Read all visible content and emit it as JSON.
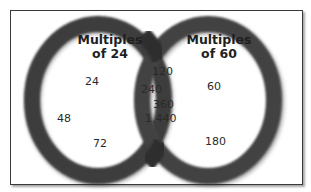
{
  "diagram": {
    "type": "venn",
    "colors": {
      "ring": "#3c3c3c",
      "ring_overlap": "#262626",
      "frame_border": "#3a3a3a",
      "background": "#ffffff",
      "text": "#2a2a2a"
    },
    "sets": [
      {
        "id": "A",
        "title_line1": "Multiples",
        "title_line2": "of 24",
        "only": [
          "24",
          "48",
          "72"
        ]
      },
      {
        "id": "B",
        "title_line1": "Multiples",
        "title_line2": "of 60",
        "only": [
          "60",
          "180"
        ]
      }
    ],
    "intersection": [
      "120",
      "240",
      "360",
      "1,440"
    ]
  }
}
